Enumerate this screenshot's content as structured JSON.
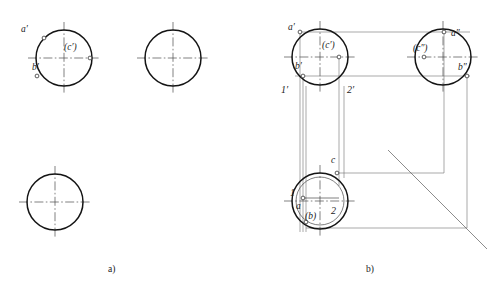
{
  "figure": {
    "captions": [
      {
        "id": "caption-a",
        "text": "a)",
        "x": 108,
        "y": 272
      },
      {
        "id": "caption-b",
        "text": "b)",
        "x": 366,
        "y": 272
      }
    ]
  },
  "panel_a": {
    "name": "panel-a-unsolved",
    "circles": [
      {
        "id": "front-view",
        "cx": 64,
        "cy": 58,
        "r": 28,
        "weight": "object"
      },
      {
        "id": "side-view",
        "cx": 173,
        "cy": 58,
        "r": 28,
        "weight": "object"
      },
      {
        "id": "top-view",
        "cx": 55,
        "cy": 202,
        "r": 28,
        "weight": "object"
      }
    ],
    "labels": [
      {
        "id": "label-a-prime",
        "text": "a′",
        "x": 21,
        "y": 32
      },
      {
        "id": "label-c-prime",
        "text": "(c′)",
        "x": 64,
        "y": 50
      },
      {
        "id": "label-b-prime",
        "text": "b′",
        "x": 32,
        "y": 70
      }
    ],
    "points": [
      {
        "id": "point-a-prime",
        "cx": 44,
        "cy": 38,
        "r": 1.9
      },
      {
        "id": "point-c-prime",
        "cx": 90,
        "cy": 58,
        "r": 1.9
      },
      {
        "id": "point-b-prime",
        "cx": 37,
        "cy": 76,
        "r": 1.9
      }
    ]
  },
  "panel_b": {
    "name": "panel-b-solved",
    "circles": [
      {
        "id": "front-view",
        "cx": 320,
        "cy": 57,
        "r": 28,
        "weight": "object"
      },
      {
        "id": "side-view",
        "cx": 443,
        "cy": 57,
        "r": 28,
        "weight": "object"
      },
      {
        "id": "top-view-outer",
        "cx": 320,
        "cy": 201,
        "r": 28,
        "weight": "object"
      },
      {
        "id": "top-view-inner-aux",
        "cx": 320,
        "cy": 201,
        "r": 24,
        "weight": "thin"
      }
    ],
    "labels_front": [
      {
        "id": "label-a-prime",
        "text": "a′",
        "x": 288,
        "y": 30
      },
      {
        "id": "label-c-prime",
        "text": "(c′)",
        "x": 322,
        "y": 48
      },
      {
        "id": "label-b-prime",
        "text": "b′",
        "x": 295,
        "y": 69
      },
      {
        "id": "label-1-prime",
        "text": "1′",
        "x": 281,
        "y": 93
      },
      {
        "id": "label-2-prime",
        "text": "2′",
        "x": 347,
        "y": 93
      }
    ],
    "labels_side": [
      {
        "id": "label-a-double-prime",
        "text": "a″",
        "x": 451,
        "y": 36
      },
      {
        "id": "label-c-double-prime",
        "text": "(c″)",
        "x": 413,
        "y": 51
      },
      {
        "id": "label-b-double-prime",
        "text": "b″",
        "x": 458,
        "y": 70
      }
    ],
    "labels_top": [
      {
        "id": "label-c",
        "text": "c",
        "x": 331,
        "y": 163
      },
      {
        "id": "label-1",
        "text": "1",
        "x": 290,
        "y": 196
      },
      {
        "id": "label-a",
        "text": "a",
        "x": 296,
        "y": 209
      },
      {
        "id": "label-b-paren",
        "text": "(b)",
        "x": 305,
        "y": 219
      },
      {
        "id": "label-2",
        "text": "2",
        "x": 331,
        "y": 214
      }
    ],
    "points_front": [
      {
        "id": "point-a-prime",
        "cx": 300,
        "cy": 32,
        "r": 1.9
      },
      {
        "id": "point-c-prime",
        "cx": 339,
        "cy": 57,
        "r": 1.9
      },
      {
        "id": "point-b-prime",
        "cx": 303,
        "cy": 76,
        "r": 1.9
      }
    ],
    "points_side": [
      {
        "id": "point-a-double-prime",
        "cx": 444,
        "cy": 32,
        "r": 1.9
      },
      {
        "id": "point-c-double-prime",
        "cx": 424,
        "cy": 57,
        "r": 1.9
      },
      {
        "id": "point-b-double-prime",
        "cx": 467,
        "cy": 76,
        "r": 1.9
      }
    ],
    "points_top": [
      {
        "id": "point-c-top",
        "cx": 337,
        "cy": 173,
        "r": 1.9
      },
      {
        "id": "point-a-top",
        "cx": 303,
        "cy": 198,
        "r": 1.9
      },
      {
        "id": "point-b-top",
        "cx": 306,
        "cy": 222,
        "r": 1.9
      }
    ],
    "mitre": {
      "id": "mitre-line",
      "x1": 388,
      "y1": 150,
      "x2": 487,
      "y2": 249,
      "angle_deg": 45
    }
  },
  "colors": {
    "object_line": "#141414",
    "thin_line": "#3b3b3b",
    "projection_line": "#6e6e6e",
    "center_line": "#4a4a4a",
    "background": "#ffffff",
    "label_text": "#1a1a1a"
  }
}
